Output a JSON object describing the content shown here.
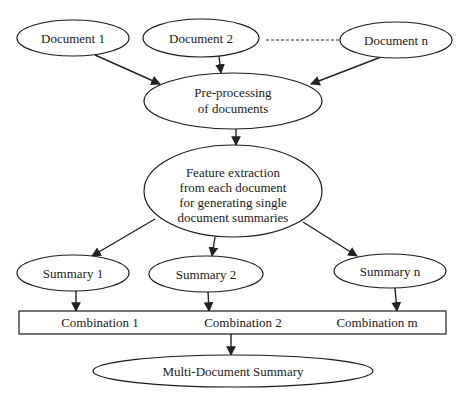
{
  "diagram": {
    "nodes": {
      "doc1": {
        "label": "Document 1"
      },
      "doc2": {
        "label": "Document 2"
      },
      "docn": {
        "label": "Document n"
      },
      "preprocess": {
        "lines": [
          "Pre-processing",
          "of documents"
        ]
      },
      "feature": {
        "lines": [
          "Feature extraction",
          "from each document",
          "for generating single",
          "document summaries"
        ]
      },
      "sum1": {
        "label": "Summary 1"
      },
      "sum2": {
        "label": "Summary 2"
      },
      "sumn": {
        "label": "Summary n"
      },
      "combo": {
        "items": [
          "Combination 1",
          "Combination 2",
          "Combination m"
        ]
      },
      "multi": {
        "label": "Multi-Document Summary"
      }
    },
    "colors": {
      "stroke": "#1a1a1a",
      "fill": "#ffffff"
    }
  }
}
